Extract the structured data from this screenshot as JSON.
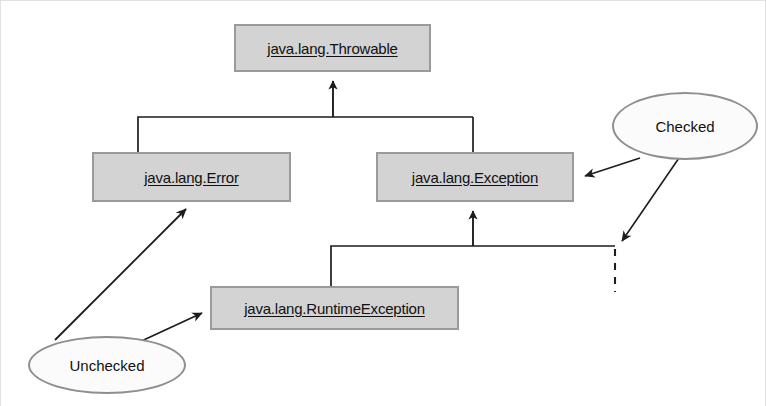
{
  "diagram": {
    "classes": [
      {
        "id": "throwable",
        "label": "java.lang.Throwable",
        "x": 234,
        "y": 24,
        "w": 197,
        "h": 48
      },
      {
        "id": "error",
        "label": "java.lang.Error",
        "x": 92,
        "y": 152,
        "w": 199,
        "h": 50
      },
      {
        "id": "exception",
        "label": "java.lang.Exception",
        "x": 376,
        "y": 152,
        "w": 198,
        "h": 50
      },
      {
        "id": "runtimeexception",
        "label": "java.lang.RuntimeException",
        "x": 210,
        "y": 286,
        "w": 249,
        "h": 44
      }
    ],
    "notes": [
      {
        "id": "checked",
        "label": "Checked",
        "x": 612,
        "y": 92,
        "w": 146,
        "h": 68
      },
      {
        "id": "unchecked",
        "label": "Unchecked",
        "x": 28,
        "y": 336,
        "w": 158,
        "h": 58
      }
    ],
    "colors": {
      "box_fill": "#d3d3d3",
      "box_border": "#9a9a9a",
      "ellipse_fill": "#fbfbfb",
      "ellipse_border": "#8f8f8f",
      "connector": "#1d1d1d",
      "page_background": "#ffffff"
    },
    "relations": [
      {
        "id": "error-to-throwable",
        "kind": "generalization",
        "from": "java.lang.Error",
        "to": "java.lang.Throwable"
      },
      {
        "id": "exception-to-throwable",
        "kind": "generalization",
        "from": "java.lang.Exception",
        "to": "java.lang.Throwable"
      },
      {
        "id": "runtimeexception-to-exception",
        "kind": "generalization",
        "from": "java.lang.RuntimeException",
        "to": "java.lang.Exception"
      },
      {
        "id": "checked-to-exception",
        "kind": "annotation",
        "from": "Checked",
        "to": "java.lang.Exception"
      },
      {
        "id": "checked-to-branch",
        "kind": "annotation",
        "from": "Checked",
        "to": "exception-subclass-branch"
      },
      {
        "id": "unchecked-to-error",
        "kind": "annotation",
        "from": "Unchecked",
        "to": "java.lang.Error"
      },
      {
        "id": "unchecked-to-runtimeexception",
        "kind": "annotation",
        "from": "Unchecked",
        "to": "java.lang.RuntimeException"
      }
    ]
  }
}
